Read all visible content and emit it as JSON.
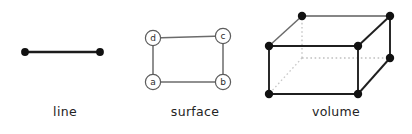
{
  "figure": {
    "title_visible": false,
    "background_color": "#ffffff",
    "stroke_color": "#4a4a4a",
    "edge_color_dark": "#1c1c1c",
    "vertex_color": "#111111",
    "hidden_edge_color": "#b9b9b9",
    "caption_color": "#232323"
  },
  "panels": [
    {
      "id": "line",
      "caption": "line",
      "dimension": "1",
      "vertex_count": 2,
      "edge_count": 1,
      "vertices": [
        {
          "name": "left-endpoint",
          "x": 25,
          "y": 52
        },
        {
          "name": "right-endpoint",
          "x": 100,
          "y": 52
        }
      ],
      "edges": [
        {
          "from": "left-endpoint",
          "to": "right-endpoint",
          "style": "solid"
        }
      ]
    },
    {
      "id": "surface",
      "caption": "surface",
      "dimension": "2",
      "vertex_count": 4,
      "edge_count": 4,
      "nodes": [
        {
          "label": "d",
          "name": "node-d",
          "x": 23,
          "y": 38
        },
        {
          "label": "c",
          "name": "node-c",
          "x": 93,
          "y": 36
        },
        {
          "label": "a",
          "name": "node-a",
          "x": 23,
          "y": 82
        },
        {
          "label": "b",
          "name": "node-b",
          "x": 93,
          "y": 82
        }
      ],
      "edges": [
        {
          "from": "d",
          "to": "c",
          "style": "solid"
        },
        {
          "from": "c",
          "to": "b",
          "style": "solid"
        },
        {
          "from": "b",
          "to": "a",
          "style": "solid"
        },
        {
          "from": "a",
          "to": "d",
          "style": "solid"
        }
      ]
    },
    {
      "id": "volume",
      "caption": "volume",
      "dimension": "3",
      "vertex_count": 8,
      "edge_count": 12,
      "vertices": [
        {
          "name": "front-bottom-left",
          "x": 9,
          "y": 94,
          "hidden": false
        },
        {
          "name": "front-bottom-right",
          "x": 98,
          "y": 94,
          "hidden": false
        },
        {
          "name": "front-top-right",
          "x": 98,
          "y": 46,
          "hidden": false
        },
        {
          "name": "front-top-left",
          "x": 9,
          "y": 46,
          "hidden": false
        },
        {
          "name": "back-bottom-left",
          "x": 42,
          "y": 58,
          "hidden": true
        },
        {
          "name": "back-bottom-right",
          "x": 130,
          "y": 58,
          "hidden": false
        },
        {
          "name": "back-top-right",
          "x": 130,
          "y": 16,
          "hidden": false
        },
        {
          "name": "back-top-left",
          "x": 42,
          "y": 16,
          "hidden": false
        }
      ],
      "edges": [
        {
          "from": "front-bottom-left",
          "to": "front-bottom-right",
          "style": "solid"
        },
        {
          "from": "front-bottom-right",
          "to": "front-top-right",
          "style": "solid"
        },
        {
          "from": "front-top-right",
          "to": "front-top-left",
          "style": "solid"
        },
        {
          "from": "front-top-left",
          "to": "front-bottom-left",
          "style": "solid"
        },
        {
          "from": "back-top-left",
          "to": "back-top-right",
          "style": "solid"
        },
        {
          "from": "back-top-right",
          "to": "back-bottom-right",
          "style": "solid"
        },
        {
          "from": "front-top-left",
          "to": "back-top-left",
          "style": "solid"
        },
        {
          "from": "front-top-right",
          "to": "back-top-right",
          "style": "solid"
        },
        {
          "from": "front-bottom-right",
          "to": "back-bottom-right",
          "style": "solid"
        },
        {
          "from": "back-bottom-left",
          "to": "back-bottom-right",
          "style": "dotted"
        },
        {
          "from": "back-bottom-left",
          "to": "back-top-left",
          "style": "dotted"
        },
        {
          "from": "back-bottom-left",
          "to": "front-bottom-left",
          "style": "dotted"
        }
      ]
    }
  ]
}
